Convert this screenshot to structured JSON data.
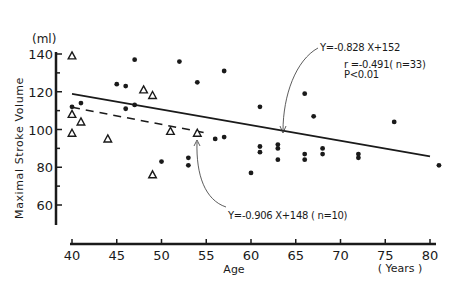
{
  "chart_data": {
    "type": "scatter",
    "title": "",
    "xlabel": "Age",
    "xunit": "(Years)",
    "ylabel": "Maximal Stroke Volume",
    "yunit": "(ml)",
    "xlim": [
      40,
      81
    ],
    "ylim": [
      50,
      140
    ],
    "xticks": [
      40,
      45,
      50,
      55,
      60,
      65,
      70,
      75,
      80
    ],
    "yticks": [
      60,
      80,
      100,
      120,
      140
    ],
    "grid": false,
    "legend": null,
    "series": [
      {
        "name": "dots",
        "marker": "filled-circle",
        "points": [
          [
            40,
            112
          ],
          [
            41,
            114
          ],
          [
            45,
            124
          ],
          [
            46,
            123
          ],
          [
            47,
            137
          ],
          [
            46,
            111
          ],
          [
            47,
            113
          ],
          [
            50,
            83
          ],
          [
            52,
            136
          ],
          [
            53,
            85
          ],
          [
            53,
            81
          ],
          [
            54,
            125
          ],
          [
            56,
            95
          ],
          [
            57,
            131
          ],
          [
            57,
            96
          ],
          [
            60,
            77
          ],
          [
            61,
            112
          ],
          [
            61,
            91
          ],
          [
            61,
            88
          ],
          [
            63,
            92
          ],
          [
            63,
            90
          ],
          [
            63,
            84
          ],
          [
            66,
            119
          ],
          [
            66,
            87
          ],
          [
            66,
            84
          ],
          [
            67,
            107
          ],
          [
            68,
            90
          ],
          [
            68,
            87
          ],
          [
            72,
            87
          ],
          [
            72,
            85
          ],
          [
            76,
            104
          ],
          [
            81,
            81
          ]
        ]
      },
      {
        "name": "triangles",
        "marker": "open-triangle",
        "points": [
          [
            40,
            139
          ],
          [
            40,
            108
          ],
          [
            41,
            104
          ],
          [
            40,
            98
          ],
          [
            44,
            95
          ],
          [
            48,
            121
          ],
          [
            49,
            118
          ],
          [
            51,
            99
          ],
          [
            54,
            98
          ],
          [
            49,
            76
          ]
        ]
      }
    ],
    "regression_lines": [
      {
        "name": "all",
        "style": "solid",
        "slope": -0.828,
        "intercept": 152,
        "x_range": [
          40,
          80
        ]
      },
      {
        "name": "triangles",
        "style": "dashed",
        "slope": -0.906,
        "intercept": 148,
        "x_range": [
          40,
          55
        ]
      }
    ],
    "annotations": [
      {
        "id": "solid_eq",
        "text": "Y=-0.828 X+152"
      },
      {
        "id": "solid_stats_r",
        "text": "r =-0.491( n=33)"
      },
      {
        "id": "solid_stats_p",
        "text": "P<0.01"
      },
      {
        "id": "dashed_eq",
        "text": "Y=-0.906 X+148 ( n=10)"
      }
    ]
  },
  "labels": {
    "yunit": "(ml)",
    "ylabel": "Maximal Stroke Volume",
    "xlabel": "Age",
    "xunit": "( Years )",
    "eq_solid": "Y=-0.828 X+152",
    "stat_r": "r =-0.491( n=33)",
    "stat_p": "P<0.01",
    "eq_dashed": "Y=-0.906 X+148 ( n=10)"
  },
  "colors": {
    "ink": "#1a1a1a",
    "background": "#ffffff"
  }
}
